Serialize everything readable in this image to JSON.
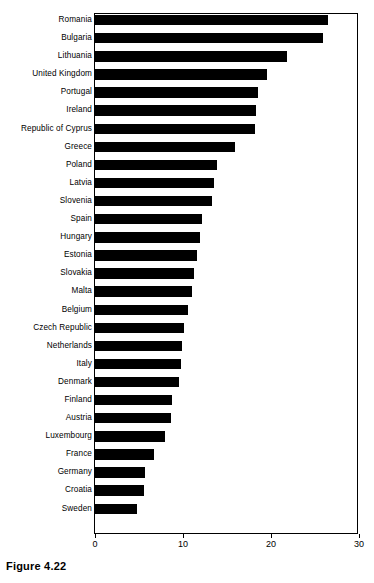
{
  "caption": "Figure 4.22",
  "chart_data": {
    "type": "bar",
    "orientation": "horizontal",
    "title": "",
    "subtitle": "",
    "xlabel": "",
    "ylabel": "",
    "xlim": [
      0,
      30
    ],
    "ylim": null,
    "grid": false,
    "legend": null,
    "legend_position": "none",
    "bar_color": "#000000",
    "background_color": "#ffffff",
    "axis_color": "#000000",
    "xticks": [
      0,
      10,
      20,
      30
    ],
    "xtick_labels": [
      "0",
      "10",
      "20",
      "30"
    ],
    "categories": [
      "Romania",
      "Bulgaria",
      "Lithuania",
      "United Kingdom",
      "Portugal",
      "Ireland",
      "Republic of Cyprus",
      "Greece",
      "Poland",
      "Latvia",
      "Slovenia",
      "Spain",
      "Hungary",
      "Estonia",
      "Slovakia",
      "Malta",
      "Belgium",
      "Czech Republic",
      "Netherlands",
      "Italy",
      "Denmark",
      "Finland",
      "Austria",
      "Luxembourg",
      "France",
      "Germany",
      "Croatia",
      "Sweden"
    ],
    "values": [
      26.5,
      25.9,
      21.8,
      19.5,
      18.5,
      18.3,
      18.2,
      15.9,
      13.9,
      13.5,
      13.3,
      12.2,
      11.9,
      11.6,
      11.3,
      11.0,
      10.6,
      10.1,
      9.9,
      9.8,
      9.5,
      8.7,
      8.6,
      8.0,
      6.7,
      5.7,
      5.6,
      4.8
    ]
  }
}
